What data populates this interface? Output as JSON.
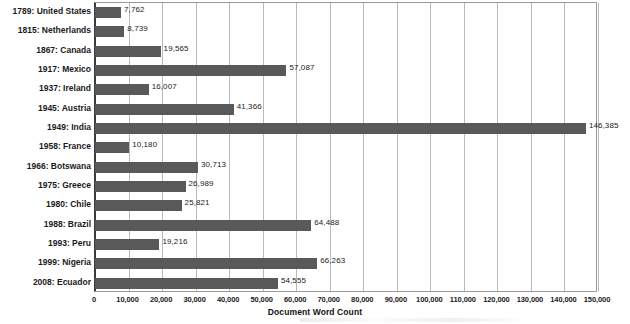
{
  "chart_data": {
    "type": "bar",
    "orientation": "horizontal",
    "title": "",
    "xlabel": "Document Word Count",
    "ylabel": "",
    "xlim": [
      0,
      150000
    ],
    "xtick_step": 10000,
    "grid": true,
    "legend": false,
    "bar_color": "#595959",
    "gridline_color": "#b9b9b9",
    "axis_color": "#3b3b3b",
    "categories": [
      "1789: United States",
      "1815: Netherlands",
      "1867: Canada",
      "1917: Mexico",
      "1937: Ireland",
      "1945: Austria",
      "1949: India",
      "1958: France",
      "1966: Botswana",
      "1975: Greece",
      "1980: Chile",
      "1988: Brazil",
      "1993: Peru",
      "1999: Nigeria",
      "2008: Ecuador"
    ],
    "values": [
      7762,
      8739,
      19565,
      57087,
      16007,
      41366,
      146385,
      10180,
      30713,
      26989,
      25821,
      64488,
      19216,
      66263,
      54555
    ],
    "value_labels": [
      "7,762",
      "8,739",
      "19,565",
      "57,087",
      "16,007",
      "41,366",
      "146,385",
      "10,180",
      "30,713",
      "26,989",
      "25,821",
      "64,488",
      "19,216",
      "66,263",
      "54,555"
    ],
    "xtick_labels": [
      "0",
      "10,000",
      "20,000",
      "30,000",
      "40,000",
      "50,000",
      "60,000",
      "70,000",
      "80,000",
      "90,000",
      "100,000",
      "110,000",
      "120,000",
      "130,000",
      "140,000",
      "150,000"
    ],
    "xtick_values": [
      0,
      10000,
      20000,
      30000,
      40000,
      50000,
      60000,
      70000,
      80000,
      90000,
      100000,
      110000,
      120000,
      130000,
      140000,
      150000
    ]
  }
}
